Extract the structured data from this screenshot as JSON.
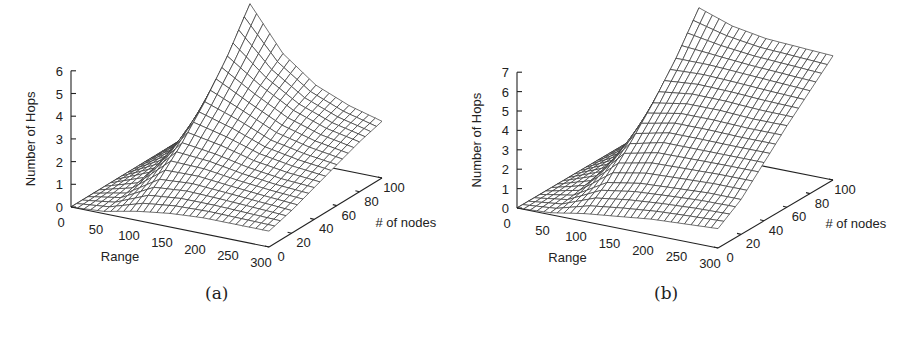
{
  "figure": {
    "panels": [
      {
        "id": "a",
        "caption": "(a)"
      },
      {
        "id": "b",
        "caption": "(b)"
      }
    ]
  },
  "chart_data": [
    {
      "type": "surface3d",
      "panel": "(a)",
      "title": "",
      "xlabel": "Range",
      "ylabel": "# of nodes",
      "zlabel": "Number of Hops",
      "x_ticks": [
        "0",
        "50",
        "100",
        "150",
        "200",
        "250",
        "300"
      ],
      "y_ticks": [
        "0",
        "20",
        "40",
        "60",
        "80",
        "100"
      ],
      "z_ticks": [
        "0",
        "1",
        "2",
        "3",
        "4",
        "5",
        "6"
      ],
      "xlim": [
        0,
        300
      ],
      "ylim": [
        0,
        100
      ],
      "zlim": [
        0,
        6
      ],
      "description": "Hops near 0 for small range; sharp ridge rising near range ~100 with peak ~6.5 at high node counts, decaying to ~2.5 at range 300",
      "x": [
        0,
        50,
        100,
        150,
        200,
        250,
        300
      ],
      "series": [
        {
          "name": "nodes=0",
          "values": [
            0,
            0.1,
            0.4,
            0.6,
            0.7,
            0.7,
            0.7
          ]
        },
        {
          "name": "nodes=20",
          "values": [
            0,
            0.3,
            1.2,
            1.3,
            1.2,
            1.1,
            1.0
          ]
        },
        {
          "name": "nodes=40",
          "values": [
            0,
            0.6,
            2.2,
            2.0,
            1.7,
            1.5,
            1.4
          ]
        },
        {
          "name": "nodes=60",
          "values": [
            0,
            0.8,
            3.4,
            2.9,
            2.3,
            2.0,
            1.8
          ]
        },
        {
          "name": "nodes=80",
          "values": [
            0,
            1.0,
            4.8,
            3.8,
            3.0,
            2.5,
            2.2
          ]
        },
        {
          "name": "nodes=100",
          "values": [
            0,
            1.2,
            6.5,
            4.6,
            3.5,
            2.9,
            2.5
          ]
        }
      ]
    },
    {
      "type": "surface3d",
      "panel": "(b)",
      "title": "",
      "xlabel": "Range",
      "ylabel": "# of nodes",
      "zlabel": "Number of Hops",
      "x_ticks": [
        "0",
        "50",
        "100",
        "150",
        "200",
        "250",
        "300"
      ],
      "y_ticks": [
        "0",
        "20",
        "40",
        "60",
        "80",
        "100"
      ],
      "z_ticks": [
        "0",
        "1",
        "2",
        "3",
        "4",
        "5",
        "6",
        "7"
      ],
      "xlim": [
        0,
        300
      ],
      "ylim": [
        0,
        100
      ],
      "zlim": [
        0,
        7
      ],
      "description": "Hops near 0 for small range; rises sharply near range ~100 to a plateau of ~6-7.5 at high node counts that stays high toward range 300",
      "x": [
        0,
        50,
        100,
        150,
        200,
        250,
        300
      ],
      "series": [
        {
          "name": "nodes=0",
          "values": [
            0,
            0.1,
            0.4,
            0.6,
            0.8,
            0.9,
            1.0
          ]
        },
        {
          "name": "nodes=20",
          "values": [
            0,
            0.3,
            1.3,
            1.6,
            1.7,
            1.8,
            1.8
          ]
        },
        {
          "name": "nodes=40",
          "values": [
            0,
            0.6,
            2.6,
            3.0,
            3.0,
            3.0,
            3.0
          ]
        },
        {
          "name": "nodes=60",
          "values": [
            0,
            0.8,
            4.0,
            4.3,
            4.3,
            4.2,
            4.2
          ]
        },
        {
          "name": "nodes=80",
          "values": [
            0,
            1.0,
            5.6,
            5.6,
            5.5,
            5.4,
            5.3
          ]
        },
        {
          "name": "nodes=100",
          "values": [
            0,
            1.2,
            7.5,
            6.9,
            6.6,
            6.5,
            6.4
          ]
        }
      ]
    }
  ]
}
